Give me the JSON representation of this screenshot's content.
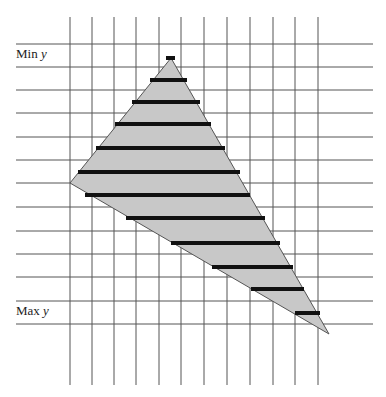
{
  "labels": {
    "min_y": "Min y",
    "min_y_prefix": "Min ",
    "max_y_prefix": "Max ",
    "y_var": "y"
  },
  "grid": {
    "vertical_x": [
      70,
      92,
      114,
      136,
      159,
      181,
      204,
      227,
      250,
      273,
      295,
      318
    ],
    "vertical_y_range": [
      17,
      385
    ],
    "horizontal_y": [
      44,
      67,
      90,
      113,
      137,
      160,
      183,
      207,
      231,
      254,
      277,
      301,
      324
    ],
    "horizontal_x_range": [
      16,
      373
    ],
    "line_color": "#555555"
  },
  "triangle": {
    "vertices": [
      [
        171,
        58
      ],
      [
        70,
        183
      ],
      [
        329,
        334
      ]
    ],
    "fill": "#c8c8c8",
    "stroke": "#555555"
  },
  "spans": [
    {
      "y": 58,
      "x1": 166,
      "x2": 175
    },
    {
      "y": 80,
      "x1": 150,
      "x2": 187
    },
    {
      "y": 102,
      "x1": 132,
      "x2": 200
    },
    {
      "y": 124,
      "x1": 115,
      "x2": 211
    },
    {
      "y": 148,
      "x1": 96,
      "x2": 225
    },
    {
      "y": 172,
      "x1": 78,
      "x2": 240
    },
    {
      "y": 195,
      "x1": 85,
      "x2": 250
    },
    {
      "y": 218,
      "x1": 126,
      "x2": 265
    },
    {
      "y": 243,
      "x1": 171,
      "x2": 280
    },
    {
      "y": 267,
      "x1": 212,
      "x2": 293
    },
    {
      "y": 289,
      "x1": 251,
      "x2": 304
    },
    {
      "y": 313,
      "x1": 295,
      "x2": 320
    }
  ],
  "span_color": "#111111"
}
